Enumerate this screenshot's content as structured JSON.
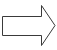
{
  "icon": {
    "name": "right-arrow-icon",
    "direction": "right",
    "stroke_color": "#3a3a3a",
    "fill_color": "#ffffff"
  }
}
